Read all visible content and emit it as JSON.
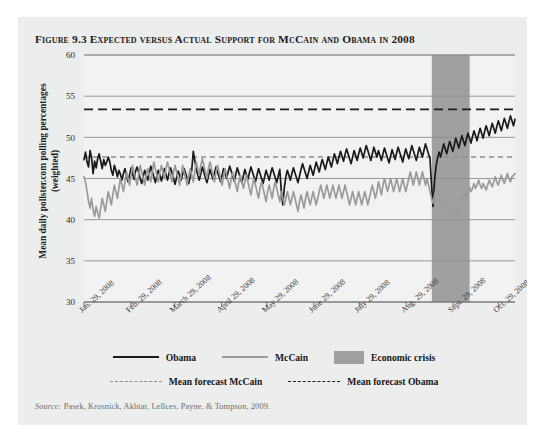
{
  "figure": {
    "number": "Figure 9.3",
    "title": "Expected versus Actual Support for McCain and Obama in 2008",
    "full_title": "Figure 9.3 Expected versus Actual Support for McCain and Obama in 2008"
  },
  "source": {
    "label": "Source:",
    "text": "Pasek, Krosnick, Akhtar, Lellces, Payne, & Tompson, 2009."
  },
  "legend": {
    "row1": [
      {
        "name": "Obama",
        "style": "solid",
        "color": "#1a1a1a"
      },
      {
        "name": "McCain",
        "style": "solid",
        "color": "#9a9a9a"
      },
      {
        "name": "Economic crisis",
        "style": "block",
        "color": "#a0a0a0"
      }
    ],
    "row2": [
      {
        "name": "Mean forecast McCain",
        "style": "dashed",
        "color": "#8e8e8e"
      },
      {
        "name": "Mean forecast Obama",
        "style": "dashed",
        "color": "#1f1f1f"
      }
    ]
  },
  "chart_data": {
    "type": "line",
    "title": "Expected versus Actual Support for McCain and Obama in 2008",
    "xlabel": "",
    "ylabel": "Mean daily pollster.com polling percentages (weighted)",
    "ylim": [
      30,
      60
    ],
    "yticks": [
      30,
      35,
      40,
      45,
      50,
      55,
      60
    ],
    "grid": true,
    "legend_position": "below-plot",
    "x_tick_labels": [
      "Jan. 29, 2008",
      "Feb. 29, 2008",
      "March 29, 2008",
      "April 29, 2008",
      "May 29, 2008",
      "June 29, 2008",
      "July 29, 2008",
      "Aug. 29, 2008",
      "Sept. 29, 2008",
      "Oct. 29, 2008"
    ],
    "x_tick_positions": [
      0,
      31,
      60,
      91,
      121,
      152,
      182,
      213,
      244,
      274
    ],
    "x_range": [
      0,
      285
    ],
    "annotations": [
      {
        "type": "band",
        "label": "Economic crisis",
        "x_start": 230,
        "x_end": 255,
        "color": "#a0a0a0"
      }
    ],
    "reference_lines": [
      {
        "name": "Mean forecast Obama",
        "value": 53.4,
        "style": "dashed",
        "color": "#1f1f1f"
      },
      {
        "name": "Mean forecast McCain",
        "value": 47.6,
        "style": "dashed",
        "color": "#8e8e8e"
      }
    ],
    "series": [
      {
        "name": "Obama",
        "color": "#1a1a1a",
        "style": "solid",
        "values": [
          47.3,
          48.2,
          47.0,
          46.4,
          48.4,
          47.5,
          45.6,
          47.1,
          46.3,
          47.4,
          48.0,
          47.1,
          46.2,
          47.3,
          46.6,
          47.0,
          47.6,
          47.0,
          46.0,
          45.4,
          46.6,
          46.0,
          45.2,
          46.0,
          45.5,
          44.8,
          45.6,
          46.2,
          45.3,
          44.6,
          45.4,
          46.3,
          45.6,
          44.9,
          45.9,
          46.4,
          45.8,
          45.0,
          44.4,
          45.2,
          46.0,
          45.5,
          44.8,
          45.6,
          46.5,
          45.9,
          45.2,
          44.5,
          45.3,
          46.0,
          45.4,
          44.7,
          45.4,
          46.2,
          45.5,
          44.8,
          45.6,
          46.3,
          45.7,
          45.0,
          44.3,
          45.1,
          45.9,
          45.4,
          44.8,
          45.5,
          46.2,
          45.6,
          45.0,
          44.4,
          45.2,
          46.0,
          48.3,
          47.2,
          46.1,
          45.4,
          44.8,
          45.6,
          46.4,
          45.8,
          45.1,
          44.5,
          45.3,
          46.1,
          45.5,
          44.9,
          45.7,
          46.4,
          45.8,
          45.2,
          44.6,
          45.4,
          46.2,
          45.6,
          45.0,
          45.8,
          46.5,
          45.9,
          45.3,
          44.7,
          45.5,
          46.3,
          45.7,
          45.1,
          44.5,
          45.3,
          46.1,
          45.5,
          44.9,
          45.7,
          46.4,
          45.8,
          45.2,
          44.6,
          45.4,
          46.2,
          45.6,
          45.0,
          44.4,
          45.2,
          46.0,
          45.4,
          44.8,
          45.6,
          46.3,
          45.7,
          45.1,
          44.5,
          45.3,
          46.1,
          43.5,
          41.8,
          43.9,
          45.2,
          46.0,
          45.4,
          44.8,
          45.6,
          46.3,
          45.7,
          45.1,
          44.5,
          45.3,
          46.1,
          46.8,
          46.2,
          45.6,
          45.0,
          45.8,
          46.6,
          46.0,
          45.4,
          46.2,
          47.0,
          46.4,
          45.8,
          46.6,
          47.3,
          46.7,
          46.1,
          46.9,
          47.6,
          47.0,
          46.4,
          47.2,
          48.0,
          47.4,
          46.8,
          47.6,
          48.3,
          47.7,
          47.1,
          47.9,
          48.6,
          48.0,
          47.4,
          46.8,
          47.6,
          48.4,
          47.8,
          47.2,
          48.0,
          48.7,
          48.1,
          47.5,
          48.3,
          49.0,
          48.4,
          47.8,
          47.2,
          48.0,
          48.8,
          48.2,
          47.6,
          48.4,
          47.8,
          47.2,
          48.0,
          48.7,
          48.1,
          47.5,
          46.9,
          47.7,
          48.5,
          47.9,
          47.3,
          48.1,
          48.8,
          48.2,
          47.6,
          47.0,
          47.8,
          48.6,
          48.0,
          47.4,
          48.2,
          49.0,
          48.4,
          47.8,
          47.2,
          48.0,
          48.8,
          48.2,
          47.6,
          48.4,
          49.2,
          48.6,
          48.0,
          47.4,
          44.2,
          41.6,
          44.8,
          46.5,
          47.5,
          48.2,
          47.6,
          48.4,
          49.2,
          48.6,
          48.0,
          48.8,
          49.5,
          48.9,
          48.3,
          49.1,
          49.9,
          49.3,
          48.7,
          49.5,
          50.2,
          49.6,
          49.0,
          49.8,
          50.5,
          49.9,
          49.3,
          50.1,
          50.8,
          50.2,
          49.6,
          50.4,
          51.1,
          50.5,
          49.9,
          50.7,
          51.4,
          50.8,
          50.2,
          51.0,
          51.7,
          51.1,
          50.5,
          51.3,
          52.0,
          51.4,
          50.8,
          51.6,
          52.3,
          51.7,
          51.1,
          51.9,
          52.6,
          52.0,
          51.4,
          52.2
        ]
      },
      {
        "name": "McCain",
        "color": "#9a9a9a",
        "style": "solid",
        "values": [
          45.2,
          44.6,
          43.4,
          42.2,
          41.4,
          42.6,
          41.2,
          40.4,
          41.6,
          40.8,
          40.2,
          41.4,
          42.6,
          41.8,
          41.0,
          42.2,
          43.4,
          42.6,
          41.8,
          43.0,
          44.2,
          43.4,
          42.6,
          43.8,
          45.0,
          44.2,
          43.4,
          44.6,
          45.8,
          45.0,
          44.2,
          45.4,
          46.6,
          45.8,
          45.0,
          44.2,
          45.4,
          46.6,
          45.8,
          45.0,
          44.2,
          45.4,
          46.2,
          45.4,
          44.6,
          45.8,
          47.0,
          46.2,
          45.4,
          44.6,
          45.8,
          46.6,
          45.8,
          45.0,
          46.2,
          47.0,
          46.2,
          45.4,
          44.6,
          45.8,
          46.6,
          45.8,
          45.0,
          44.2,
          45.4,
          46.6,
          45.8,
          45.0,
          44.2,
          45.4,
          46.2,
          45.4,
          44.6,
          45.8,
          47.0,
          46.2,
          45.4,
          46.6,
          47.4,
          46.6,
          45.8,
          45.0,
          46.2,
          47.0,
          46.2,
          45.4,
          44.6,
          45.8,
          46.6,
          45.8,
          45.0,
          44.2,
          45.4,
          46.2,
          45.4,
          44.6,
          43.8,
          45.0,
          45.8,
          45.0,
          44.2,
          43.4,
          44.6,
          45.4,
          44.6,
          43.8,
          44.6,
          45.4,
          44.6,
          43.8,
          43.0,
          44.2,
          45.0,
          44.2,
          43.4,
          42.6,
          43.8,
          44.6,
          43.8,
          43.0,
          42.2,
          43.4,
          44.2,
          43.4,
          42.6,
          43.8,
          44.6,
          43.8,
          43.0,
          42.2,
          43.4,
          42.6,
          41.8,
          42.6,
          43.4,
          42.6,
          41.8,
          42.6,
          43.4,
          42.6,
          41.8,
          41.0,
          42.2,
          43.0,
          42.2,
          41.4,
          42.6,
          43.4,
          42.6,
          41.8,
          42.6,
          43.4,
          42.6,
          41.8,
          42.6,
          43.4,
          44.2,
          43.4,
          42.6,
          43.4,
          44.2,
          43.4,
          42.6,
          43.4,
          44.2,
          43.4,
          42.6,
          43.4,
          44.2,
          43.4,
          42.6,
          43.4,
          44.2,
          43.4,
          42.6,
          41.8,
          42.6,
          43.4,
          42.6,
          41.8,
          42.6,
          43.4,
          42.6,
          41.8,
          42.6,
          43.4,
          42.6,
          41.8,
          42.6,
          43.4,
          44.2,
          43.4,
          42.6,
          43.4,
          44.6,
          43.8,
          43.0,
          44.2,
          45.0,
          44.2,
          43.4,
          44.2,
          45.0,
          44.2,
          43.4,
          44.2,
          45.0,
          44.2,
          43.4,
          44.2,
          45.0,
          44.2,
          43.4,
          44.2,
          45.0,
          45.8,
          45.0,
          44.2,
          45.0,
          45.8,
          45.0,
          44.2,
          45.0,
          45.8,
          45.0,
          44.2,
          45.0,
          44.2,
          43.4,
          42.6,
          42.0,
          43.0,
          43.8,
          43.4,
          43.0,
          42.6,
          42.0,
          41.6,
          42.2,
          41.8,
          41.4,
          41.0,
          40.6,
          41.2,
          40.8,
          40.4,
          41.0,
          40.6,
          41.4,
          42.2,
          42.8,
          43.4,
          42.8,
          43.4,
          44.0,
          43.4,
          43.8,
          44.4,
          43.8,
          44.2,
          44.8,
          44.2,
          43.8,
          44.4,
          44.0,
          43.6,
          44.2,
          44.8,
          44.4,
          44.0,
          44.6,
          45.2,
          44.6,
          44.2,
          44.8,
          45.4,
          44.8,
          44.4,
          45.0,
          45.6,
          45.0,
          44.6,
          45.2,
          45.4,
          45.6
        ]
      }
    ]
  }
}
